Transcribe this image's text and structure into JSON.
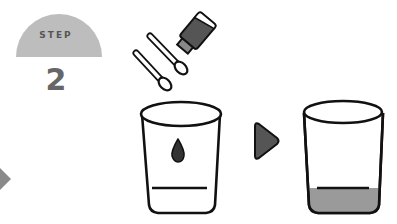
{
  "badge": {
    "label": "STEP",
    "number": "2",
    "color": "#bdbdbd",
    "text_color": "#5a5a5a"
  },
  "illustration": {
    "items": [
      {
        "name": "dropper-bottle",
        "description": "tilted dark bottle"
      },
      {
        "name": "cotton-swab-1"
      },
      {
        "name": "cotton-swab-2"
      },
      {
        "name": "cup-before",
        "description": "empty cup with a single drop and a fill line"
      },
      {
        "name": "arrow-right",
        "color": "#555555"
      },
      {
        "name": "cup-after",
        "description": "cup filled with liquid up to the fill line",
        "liquid_color": "#9a9a9a"
      }
    ]
  },
  "left_arrow": {
    "color": "#777777"
  }
}
